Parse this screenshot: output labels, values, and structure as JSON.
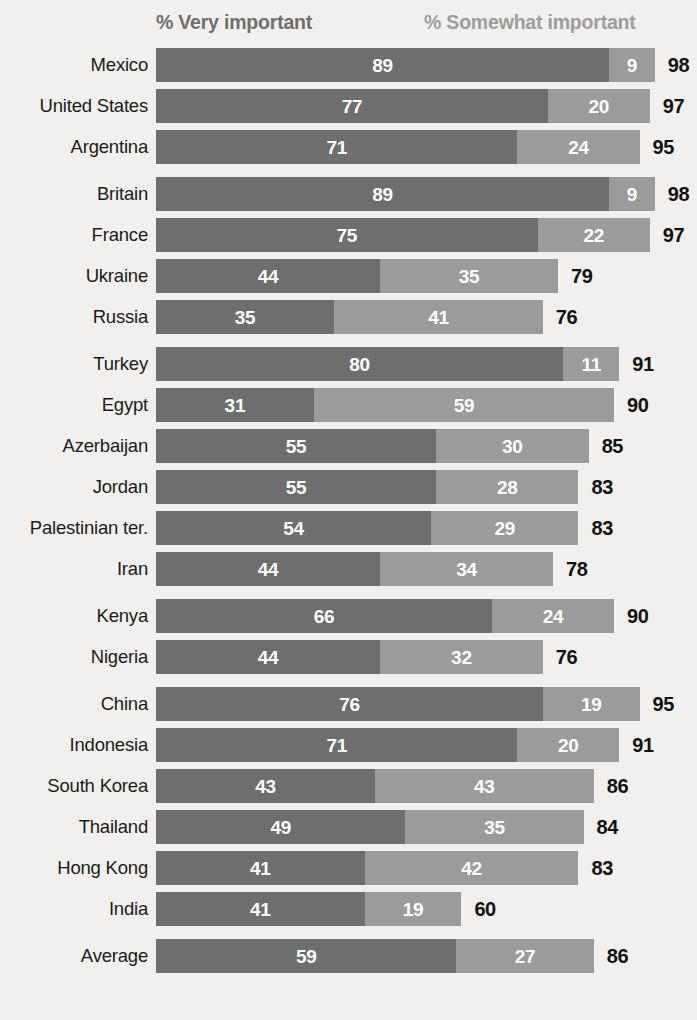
{
  "legend": {
    "very_label": "% Very important",
    "somewhat_label": "% Somewhat important",
    "very_color": "#6e6e6e",
    "somewhat_color": "#9b9b9b"
  },
  "background_color": "#f1f0ee",
  "chart_data": {
    "type": "bar",
    "subtype": "stacked-horizontal",
    "title": "",
    "xlabel": "",
    "ylabel": "",
    "xlim": [
      0,
      100
    ],
    "grid": false,
    "legend_position": "top",
    "series": [
      {
        "name": "% Very important",
        "color": "#6e6e6e"
      },
      {
        "name": "% Somewhat important",
        "color": "#9b9b9b"
      }
    ],
    "categories": [
      "Mexico",
      "United States",
      "Argentina",
      "Britain",
      "France",
      "Ukraine",
      "Russia",
      "Turkey",
      "Egypt",
      "Azerbaijan",
      "Jordan",
      "Palestinian ter.",
      "Iran",
      "Kenya",
      "Nigeria",
      "China",
      "Indonesia",
      "South Korea",
      "Thailand",
      "Hong Kong",
      "India",
      "Average"
    ],
    "groups": [
      {
        "rows": [
          {
            "label": "Mexico",
            "very": 89,
            "somewhat": 9,
            "total": 98
          },
          {
            "label": "United States",
            "very": 77,
            "somewhat": 20,
            "total": 97
          },
          {
            "label": "Argentina",
            "very": 71,
            "somewhat": 24,
            "total": 95
          }
        ]
      },
      {
        "rows": [
          {
            "label": "Britain",
            "very": 89,
            "somewhat": 9,
            "total": 98
          },
          {
            "label": "France",
            "very": 75,
            "somewhat": 22,
            "total": 97
          },
          {
            "label": "Ukraine",
            "very": 44,
            "somewhat": 35,
            "total": 79
          },
          {
            "label": "Russia",
            "very": 35,
            "somewhat": 41,
            "total": 76
          }
        ]
      },
      {
        "rows": [
          {
            "label": "Turkey",
            "very": 80,
            "somewhat": 11,
            "total": 91
          },
          {
            "label": "Egypt",
            "very": 31,
            "somewhat": 59,
            "total": 90
          },
          {
            "label": "Azerbaijan",
            "very": 55,
            "somewhat": 30,
            "total": 85
          },
          {
            "label": "Jordan",
            "very": 55,
            "somewhat": 28,
            "total": 83
          },
          {
            "label": "Palestinian ter.",
            "very": 54,
            "somewhat": 29,
            "total": 83
          },
          {
            "label": "Iran",
            "very": 44,
            "somewhat": 34,
            "total": 78
          }
        ]
      },
      {
        "rows": [
          {
            "label": "Kenya",
            "very": 66,
            "somewhat": 24,
            "total": 90
          },
          {
            "label": "Nigeria",
            "very": 44,
            "somewhat": 32,
            "total": 76
          }
        ]
      },
      {
        "rows": [
          {
            "label": "China",
            "very": 76,
            "somewhat": 19,
            "total": 95
          },
          {
            "label": "Indonesia",
            "very": 71,
            "somewhat": 20,
            "total": 91
          },
          {
            "label": "South Korea",
            "very": 43,
            "somewhat": 43,
            "total": 86
          },
          {
            "label": "Thailand",
            "very": 49,
            "somewhat": 35,
            "total": 84
          },
          {
            "label": "Hong Kong",
            "very": 41,
            "somewhat": 42,
            "total": 83
          },
          {
            "label": "India",
            "very": 41,
            "somewhat": 19,
            "total": 60
          }
        ]
      },
      {
        "rows": [
          {
            "label": "Average",
            "very": 59,
            "somewhat": 27,
            "total": 86
          }
        ]
      }
    ]
  }
}
